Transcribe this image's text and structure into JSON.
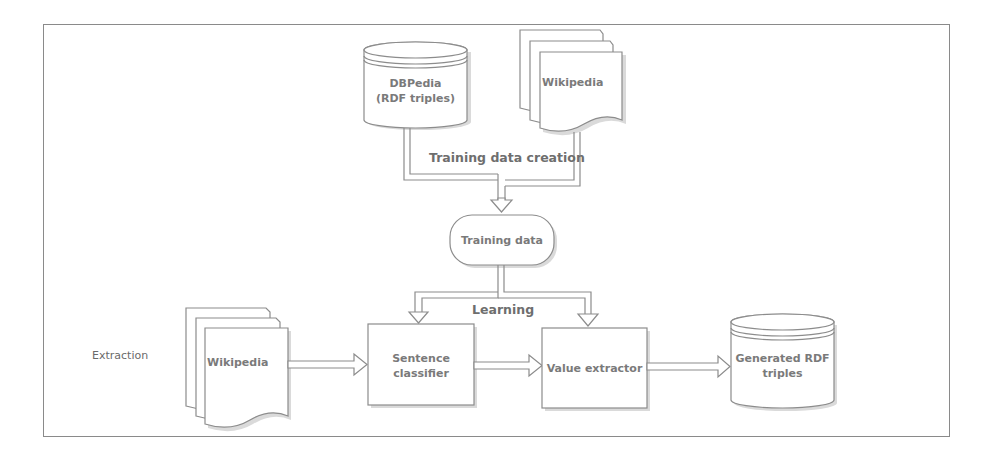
{
  "diagram": {
    "type": "flowchart",
    "nodes": {
      "dbpedia": {
        "shape": "cylinder",
        "line1": "DBPedia",
        "line2": "(RDF triples)"
      },
      "wikipedia_top": {
        "shape": "document-stack",
        "label": "Wikipedia"
      },
      "training_data": {
        "shape": "rounded-pill",
        "label": "Training data"
      },
      "wikipedia_bottom": {
        "shape": "document-stack",
        "label": "Wikipedia"
      },
      "sentence_classifier": {
        "shape": "rectangle",
        "line1": "Sentence",
        "line2": "classifier"
      },
      "value_extractor": {
        "shape": "rectangle",
        "label": "Value extractor"
      },
      "generated_rdf": {
        "shape": "cylinder",
        "line1": "Generated RDF",
        "line2": "triples"
      }
    },
    "edge_labels": {
      "training_data_creation": "Training data creation",
      "learning": "Learning"
    },
    "section_labels": {
      "extraction": "Extraction"
    },
    "edges": [
      {
        "from": "dbpedia",
        "to": "training_data",
        "label": "Training data creation"
      },
      {
        "from": "wikipedia_top",
        "to": "training_data",
        "label": "Training data creation"
      },
      {
        "from": "training_data",
        "to": "sentence_classifier",
        "label": "Learning"
      },
      {
        "from": "training_data",
        "to": "value_extractor",
        "label": "Learning"
      },
      {
        "from": "wikipedia_bottom",
        "to": "sentence_classifier"
      },
      {
        "from": "sentence_classifier",
        "to": "value_extractor"
      },
      {
        "from": "value_extractor",
        "to": "generated_rdf"
      }
    ],
    "colors": {
      "stroke": "#8c8c8c",
      "fill": "#ffffff",
      "shadow": "#d6d6d6",
      "text": "#7a7a7a"
    }
  }
}
